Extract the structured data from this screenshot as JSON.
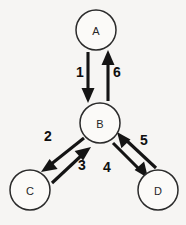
{
  "diagram": {
    "type": "directed-graph",
    "background_color": "#f6f5f3",
    "ink_color": "#141414",
    "nodes": [
      {
        "id": "A",
        "label": "A",
        "cx": 96,
        "cy": 30,
        "r": 20
      },
      {
        "id": "B",
        "label": "B",
        "cx": 100,
        "cy": 123,
        "r": 20
      },
      {
        "id": "C",
        "label": "C",
        "cx": 30,
        "cy": 190,
        "r": 20
      },
      {
        "id": "D",
        "label": "D",
        "cx": 158,
        "cy": 190,
        "r": 20
      }
    ],
    "edges": [
      {
        "label": "1",
        "from": "A",
        "to": "B",
        "direction": "down",
        "x1": 88,
        "y1": 52,
        "x2": 88,
        "y2": 101,
        "label_x": 80,
        "label_y": 72
      },
      {
        "label": "6",
        "from": "B",
        "to": "A",
        "direction": "up",
        "x1": 108,
        "y1": 101,
        "x2": 108,
        "y2": 52,
        "label_x": 117,
        "label_y": 72
      },
      {
        "label": "2",
        "from": "B",
        "to": "C",
        "direction": "down-left",
        "x1": 82,
        "y1": 137,
        "x2": 44,
        "y2": 168,
        "label_x": 48,
        "label_y": 136
      },
      {
        "label": "3",
        "from": "C",
        "to": "B",
        "direction": "up-right",
        "x1": 50,
        "y1": 181,
        "x2": 88,
        "y2": 146,
        "label_x": 82,
        "label_y": 165
      },
      {
        "label": "4",
        "from": "B",
        "to": "D",
        "direction": "down-right",
        "x1": 112,
        "y1": 142,
        "x2": 146,
        "y2": 176,
        "label_x": 107,
        "label_y": 167
      },
      {
        "label": "5",
        "from": "D",
        "to": "B",
        "direction": "up-left",
        "x1": 158,
        "y1": 170,
        "x2": 120,
        "y2": 134,
        "label_x": 144,
        "label_y": 140
      }
    ]
  }
}
